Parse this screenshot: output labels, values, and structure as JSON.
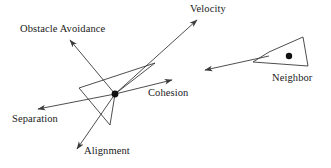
{
  "diagram": {
    "type": "vector-force-diagram",
    "background_color": "#ffffff",
    "stroke_color": "#3a3a3a",
    "text_color": "#1a1a1a",
    "labels": {
      "obstacle_avoidance": "Obstacle Avoidance",
      "velocity": "Velocity",
      "cohesion": "Cohesion",
      "separation": "Separation",
      "alignment": "Alignment",
      "neighbor": "Neighbor"
    },
    "boid": {
      "name": "primary-boid",
      "center": {
        "x": 115,
        "y": 94
      },
      "outline_points": "155,63 79,88 110,125 115,94",
      "dot_radius": 3.4
    },
    "neighbor": {
      "name": "neighbor-boid",
      "center": {
        "x": 289,
        "y": 56
      },
      "outline_points": "303,37 308,66 253,62 269,52",
      "dot_radius": 3.2,
      "velocity_arrow": {
        "from_x": 269,
        "from_y": 56,
        "to_x": 205,
        "to_y": 70
      }
    },
    "vectors": [
      {
        "name": "velocity",
        "label": "Velocity",
        "from_x": 115,
        "from_y": 94,
        "to_x": 197,
        "to_y": 20
      },
      {
        "name": "obstacle-avoidance",
        "label": "Obstacle Avoidance",
        "from_x": 115,
        "from_y": 94,
        "to_x": 70,
        "to_y": 40
      },
      {
        "name": "cohesion",
        "label": "Cohesion",
        "from_x": 115,
        "from_y": 94,
        "to_x": 172,
        "to_y": 80
      },
      {
        "name": "separation",
        "label": "Separation",
        "from_x": 115,
        "from_y": 94,
        "to_x": 38,
        "to_y": 109
      },
      {
        "name": "alignment",
        "label": "Alignment",
        "from_x": 115,
        "from_y": 94,
        "to_x": 77,
        "to_y": 149
      }
    ],
    "label_positions": {
      "obstacle_avoidance": {
        "left": 20,
        "top": 24
      },
      "velocity": {
        "left": 190,
        "top": 4
      },
      "cohesion": {
        "left": 148,
        "top": 88
      },
      "separation": {
        "left": 12,
        "top": 114
      },
      "alignment": {
        "left": 84,
        "top": 146
      },
      "neighbor": {
        "left": 272,
        "top": 73
      }
    }
  }
}
